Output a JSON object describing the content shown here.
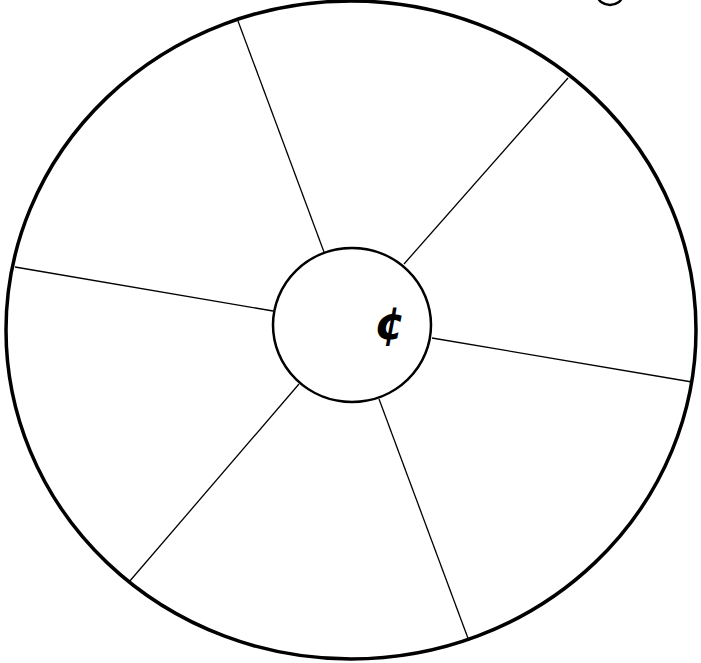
{
  "diagram": {
    "type": "spoke-wheel",
    "outer_circle": {
      "cx": 351,
      "cy": 330,
      "rx": 345,
      "ry": 329,
      "stroke_width": 3.5
    },
    "inner_circle": {
      "cx": 352,
      "cy": 325,
      "rx": 79,
      "ry": 77,
      "stroke_width": 2.5
    },
    "center_symbol": "¢",
    "spokes": [
      {
        "name": "spoke-top-left",
        "x1": 324,
        "y1": 252,
        "x2": 238,
        "y2": 21
      },
      {
        "name": "spoke-top-right",
        "x1": 404,
        "y1": 264,
        "x2": 568,
        "y2": 78
      },
      {
        "name": "spoke-right",
        "x1": 432,
        "y1": 338,
        "x2": 692,
        "y2": 382
      },
      {
        "name": "spoke-bottom-right",
        "x1": 379,
        "y1": 399,
        "x2": 469,
        "y2": 641
      },
      {
        "name": "spoke-bottom-left",
        "x1": 299,
        "y1": 384,
        "x2": 129,
        "y2": 582
      },
      {
        "name": "spoke-left",
        "x1": 273,
        "y1": 311,
        "x2": 15,
        "y2": 267
      }
    ],
    "segment_count": 6,
    "line_color": "#000000",
    "background_color": "#ffffff"
  }
}
